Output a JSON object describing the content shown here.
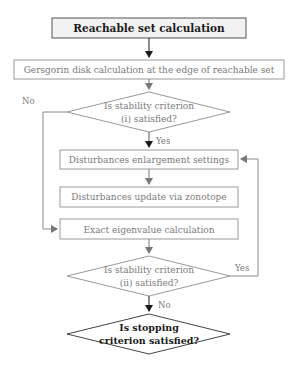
{
  "diagram": {
    "type": "flowchart",
    "nodes": {
      "reachable": {
        "label": "Reachable set calculation",
        "shape": "rect"
      },
      "gersgorin": {
        "label": "Gersgorin disk calculation at the edge of reachable set",
        "shape": "rect"
      },
      "crit1": {
        "line1": "Is stability criterion",
        "line2": "(i) satisfied?",
        "shape": "diamond"
      },
      "enlarge": {
        "label": "Disturbances enlargement settings",
        "shape": "rect"
      },
      "update": {
        "label": "Disturbances update via zonotope",
        "shape": "rect"
      },
      "eigen": {
        "label": "Exact eigenvalue calculation",
        "shape": "rect"
      },
      "crit2": {
        "line1": "Is stability criterion",
        "line2": "(ii) satisfied?",
        "shape": "diamond"
      },
      "stop": {
        "line1": "Is stopping",
        "line2": "criterion satisfied?",
        "shape": "diamond"
      }
    },
    "edges": {
      "crit1_no": "No",
      "crit1_yes": "Yes",
      "crit2_yes": "Yes",
      "crit2_no": "No"
    },
    "colors": {
      "dark": "#1a1a1a",
      "gray": "#8a8a8a",
      "box_fill_top": "#f2f2f2"
    }
  }
}
